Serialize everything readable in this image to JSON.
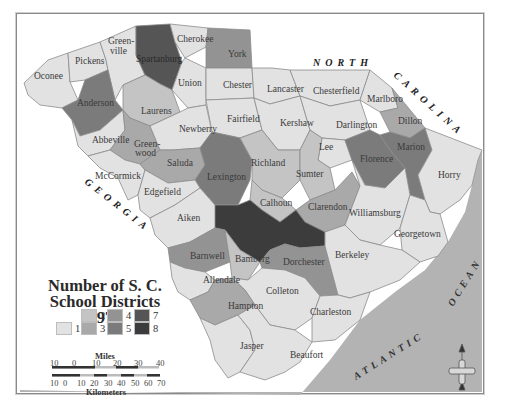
{
  "map": {
    "title_line1": "Number of S. C.",
    "title_line2": "School Districts 1970",
    "neighbors": {
      "north": "NORTH",
      "carolina": "CAROLINA",
      "georgia": "GEORGIA",
      "atlantic": "ATLANTIC",
      "ocean": "OCEAN"
    },
    "colors": {
      "1": "#e2e2e2",
      "2": "#c4c4c4",
      "3": "#a9a9a9",
      "4": "#939393",
      "5": "#7b7b7b",
      "7": "#555555",
      "8": "#3c3c3c",
      "ocean": "#b3b3b3",
      "land_outside": "#ffffff"
    },
    "legend": [
      {
        "value": "1",
        "label": "1"
      },
      {
        "value": "2",
        "label": "2"
      },
      {
        "value": "3",
        "label": "3"
      },
      {
        "value": "4",
        "label": "4"
      },
      {
        "value": "5",
        "label": "5"
      },
      {
        "value": "7",
        "label": "7"
      },
      {
        "value": "8",
        "label": "8"
      }
    ],
    "counties": [
      {
        "name": "Oconee",
        "label": "Oconee",
        "districts": 1
      },
      {
        "name": "Pickens",
        "label": "Pickens",
        "districts": 1
      },
      {
        "name": "Greenville",
        "label_line1": "Green-",
        "label_line2": "ville",
        "districts": 1
      },
      {
        "name": "Spartanburg",
        "label": "Spartanburg",
        "districts": 7
      },
      {
        "name": "Cherokee",
        "label": "Cherokee",
        "districts": 1
      },
      {
        "name": "York",
        "label": "York",
        "districts": 4
      },
      {
        "name": "Anderson",
        "label": "Anderson",
        "districts": 5
      },
      {
        "name": "Union",
        "label": "Union",
        "districts": 1
      },
      {
        "name": "Chester",
        "label": "Chester",
        "districts": 1
      },
      {
        "name": "Lancaster",
        "label": "Lancaster",
        "districts": 1
      },
      {
        "name": "Chesterfield",
        "label": "Chesterfield",
        "districts": 1
      },
      {
        "name": "Marlboro",
        "label": "Marlboro",
        "districts": 1
      },
      {
        "name": "Dillon",
        "label": "Dillon",
        "districts": 3
      },
      {
        "name": "Laurens",
        "label": "Laurens",
        "districts": 2
      },
      {
        "name": "Fairfield",
        "label": "Fairfield",
        "districts": 1
      },
      {
        "name": "Kershaw",
        "label": "Kershaw",
        "districts": 1
      },
      {
        "name": "Darlington",
        "label": "Darlington",
        "districts": 1
      },
      {
        "name": "Abbeville",
        "label": "Abbeville",
        "districts": 1
      },
      {
        "name": "Greenwood",
        "label_line1": "Green-",
        "label_line2": "wood",
        "districts": 3
      },
      {
        "name": "Newberry",
        "label": "Newberry",
        "districts": 1
      },
      {
        "name": "Lee",
        "label": "Lee",
        "districts": 1
      },
      {
        "name": "Florence",
        "label": "Florence",
        "districts": 5
      },
      {
        "name": "Marion",
        "label": "Marion",
        "districts": 5
      },
      {
        "name": "Horry",
        "label": "Horry",
        "districts": 1
      },
      {
        "name": "McCormick",
        "label": "McCormick",
        "districts": 1
      },
      {
        "name": "Saluda",
        "label": "Saluda",
        "districts": 3
      },
      {
        "name": "Lexington",
        "label": "Lexington",
        "districts": 5
      },
      {
        "name": "Richland",
        "label": "Richland",
        "districts": 2
      },
      {
        "name": "Sumter",
        "label": "Sumter",
        "districts": 2
      },
      {
        "name": "Edgefield",
        "label": "Edgefield",
        "districts": 1
      },
      {
        "name": "Calhoun",
        "label": "Calhoun",
        "districts": 2
      },
      {
        "name": "Clarendon",
        "label": "Clarendon",
        "districts": 3
      },
      {
        "name": "Williamsburg",
        "label": "Williamsburg",
        "districts": 1
      },
      {
        "name": "Aiken",
        "label": "Aiken",
        "districts": 1
      },
      {
        "name": "Orangeburg",
        "label": "",
        "districts": 8
      },
      {
        "name": "Georgetown",
        "label": "Georgetown",
        "districts": 1
      },
      {
        "name": "Barnwell",
        "label": "Barnwell",
        "districts": 4
      },
      {
        "name": "Bamberg",
        "label": "Bamberg",
        "districts": 2
      },
      {
        "name": "Dorchester",
        "label": "Dorchester",
        "districts": 4
      },
      {
        "name": "Berkeley",
        "label": "Berkeley",
        "districts": 1
      },
      {
        "name": "Allendale",
        "label": "Allendale",
        "districts": 1
      },
      {
        "name": "Colleton",
        "label": "Colleton",
        "districts": 1
      },
      {
        "name": "Hampton",
        "label": "Hampton",
        "districts": 3
      },
      {
        "name": "Charleston",
        "label": "Charleston",
        "districts": 1
      },
      {
        "name": "Jasper",
        "label": "Jasper",
        "districts": 1
      },
      {
        "name": "Beaufort",
        "label": "Beaufort",
        "districts": 1
      }
    ],
    "scale": {
      "miles_title": "Miles",
      "miles_ticks": [
        "10",
        "0",
        "10",
        "20",
        "30",
        "40"
      ],
      "km_title": "Kilometers",
      "km_ticks": [
        "10",
        "0",
        "10",
        "20",
        "30",
        "40",
        "50",
        "60",
        "70"
      ]
    },
    "compass": {
      "icon": "north-arrow-icon"
    }
  }
}
